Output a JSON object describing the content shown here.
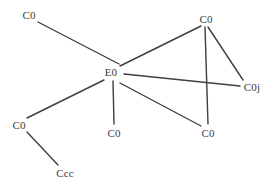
{
  "diagram": {
    "background_color": "#ffffff",
    "edge_color": "#3f3f3f",
    "label_color": "#3a3a3a",
    "edge_width": 1.4,
    "width": 274,
    "height": 184,
    "nodes": [
      {
        "id": "e0",
        "label": "E0",
        "x": 111,
        "y": 72
      },
      {
        "id": "c0_top_left",
        "label": "C0",
        "x": 29,
        "y": 15
      },
      {
        "id": "c0_top_right",
        "label": "C0",
        "x": 206,
        "y": 19
      },
      {
        "id": "c0j_right",
        "label": "C0j",
        "x": 252,
        "y": 87
      },
      {
        "id": "c0_bottom_right",
        "label": "C0",
        "x": 208,
        "y": 133
      },
      {
        "id": "c0_bottom_mid",
        "label": "C0",
        "x": 114,
        "y": 133
      },
      {
        "id": "c0_left_low",
        "label": "C0",
        "x": 19,
        "y": 125
      },
      {
        "id": "ccc_bottom",
        "label": "Ccc",
        "x": 65,
        "y": 173
      }
    ],
    "edges": [
      {
        "from": "e0",
        "to": "c0_top_left",
        "x1": 119,
        "y1": 64,
        "x2": 38,
        "y2": 22
      },
      {
        "from": "e0",
        "to": "c0_top_right",
        "x1": 120,
        "y1": 66,
        "x2": 201,
        "y2": 26
      },
      {
        "from": "e0",
        "to": "c0j_right",
        "x1": 124,
        "y1": 74,
        "x2": 240,
        "y2": 86
      },
      {
        "from": "e0",
        "to": "c0_bottom_mid",
        "x1": 113,
        "y1": 81,
        "x2": 114,
        "y2": 124
      },
      {
        "from": "e0",
        "to": "c0_bottom_right",
        "x1": 120,
        "y1": 83,
        "x2": 201,
        "y2": 126
      },
      {
        "from": "e0",
        "to": "c0_left_low",
        "x1": 104,
        "y1": 80,
        "x2": 27,
        "y2": 118
      },
      {
        "from": "c0_left_low",
        "to": "ccc_bottom",
        "x1": 27,
        "y1": 132,
        "x2": 58,
        "y2": 165
      },
      {
        "from": "c0_top_right",
        "to": "c0j_right",
        "x1": 208,
        "y1": 27,
        "x2": 243,
        "y2": 80
      },
      {
        "from": "c0_top_right",
        "to": "c0_bottom_right",
        "x1": 205,
        "y1": 27,
        "x2": 208,
        "y2": 124
      }
    ]
  }
}
